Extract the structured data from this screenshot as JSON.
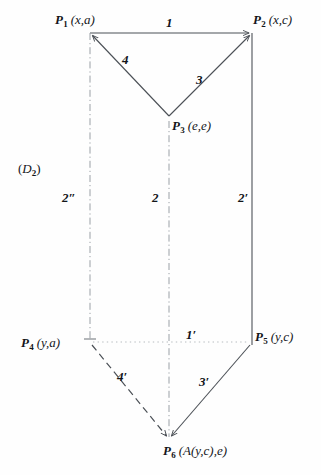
{
  "figure": {
    "name": "(D_2)",
    "name_parts": {
      "open": "(",
      "symbol": "D",
      "subscript": "2",
      "close": ")"
    }
  },
  "vertices": [
    {
      "id": "P1",
      "symbol": "P",
      "subscript": "1",
      "args": "(x,a)",
      "x": 90,
      "y": 33,
      "label_x": 55,
      "label_y": 13
    },
    {
      "id": "P2",
      "symbol": "P",
      "subscript": "2",
      "args": "(x,c)",
      "x": 252,
      "y": 33,
      "label_x": 253,
      "label_y": 13
    },
    {
      "id": "P3",
      "symbol": "P",
      "subscript": "3",
      "args": "(e,e)",
      "x": 169,
      "y": 116,
      "label_x": 172,
      "label_y": 119
    },
    {
      "id": "P4",
      "symbol": "P",
      "subscript": "4",
      "args": "(y,a)",
      "x": 90,
      "y": 342,
      "label_x": 21,
      "label_y": 336
    },
    {
      "id": "P5",
      "symbol": "P",
      "subscript": "5",
      "args": "(y,c)",
      "x": 252,
      "y": 342,
      "label_x": 255,
      "label_y": 330
    },
    {
      "id": "P6",
      "symbol": "P",
      "subscript": "6",
      "args": "(A(y,c),e)",
      "x": 169,
      "y": 440,
      "label_x": 163,
      "label_y": 444
    }
  ],
  "edges": [
    {
      "id": "e1",
      "label": "1",
      "from": "P1",
      "to": "P2",
      "style": "solid",
      "label_x": 166,
      "label_y": 16
    },
    {
      "id": "e4",
      "label": "4",
      "from": "P1",
      "to": "P3",
      "style": "solid",
      "label_x": 122,
      "label_y": 53
    },
    {
      "id": "e3",
      "label": "3",
      "from": "P2",
      "to": "P3",
      "style": "solid",
      "label_x": 196,
      "label_y": 73
    },
    {
      "id": "e2pp",
      "label": "2″",
      "from": "P1",
      "to": "P4",
      "style": "dashdot",
      "label_x": 62,
      "label_y": 191
    },
    {
      "id": "e2",
      "label": "2",
      "from": "P3",
      "to": "P6",
      "style": "dashdot",
      "label_x": 152,
      "label_y": 191
    },
    {
      "id": "e2p",
      "label": "2′",
      "from": "P2",
      "to": "P5",
      "style": "solid",
      "label_x": 238,
      "label_y": 191
    },
    {
      "id": "e1p",
      "label": "1′",
      "from": "P4",
      "to": "P5",
      "style": "dotted",
      "label_x": 186,
      "label_y": 328
    },
    {
      "id": "e4p",
      "label": "4′",
      "from": "P4",
      "to": "P6",
      "style": "dashed",
      "label_x": 117,
      "label_y": 370
    },
    {
      "id": "e3p",
      "label": "3′",
      "from": "P5",
      "to": "P6",
      "style": "solid",
      "label_x": 199,
      "label_y": 375
    }
  ],
  "colors": {
    "line": "#4b5056",
    "line_faint": "#9aa0a6",
    "text": "#14161a",
    "background": "#fefefe"
  }
}
